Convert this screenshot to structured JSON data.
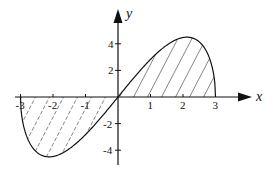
{
  "diagram": {
    "x_axis_label": "x",
    "y_axis_label": "y",
    "x_ticks": [
      "-3",
      "-2",
      "-1",
      "1",
      "2",
      "3"
    ],
    "y_ticks": [
      "4",
      "2",
      "-2",
      "-4"
    ],
    "curve": "y = x·sqrt(9 − x²), x ∈ [−3, 3]",
    "shaded_regions": [
      "between curve and x-axis for x in [-3,0]",
      "between curve and x-axis for x in [0,3]"
    ],
    "colors": {
      "ink": "#111111",
      "background": "#ffffff"
    }
  }
}
